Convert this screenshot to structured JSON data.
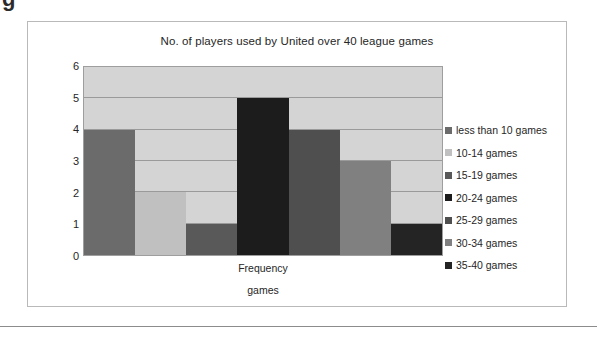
{
  "stray_glyph": "g",
  "chart_data": {
    "type": "bar",
    "title": "No. of players used by United over 40 league games",
    "xlabel": "games",
    "ylabel": "Frequency",
    "category_label": "Frequency",
    "ylim": [
      0,
      6
    ],
    "yticks": [
      "6",
      "5",
      "4",
      "3",
      "2",
      "1",
      "0"
    ],
    "grid": true,
    "legend_position": "right",
    "categories": [
      "less than 10 games",
      "10-14 games",
      "15-19 games",
      "20-24 games",
      "25-29 games",
      "30-34 games",
      "35-40 games"
    ],
    "values": [
      4,
      2,
      1,
      5,
      4,
      3,
      1
    ],
    "colors": [
      "#6b6b6b",
      "#c0c0c0",
      "#595959",
      "#1c1c1c",
      "#4f4f4f",
      "#808080",
      "#242424"
    ]
  },
  "colors": {
    "plot_background": "#d4d4d4",
    "gridline": "#9a9a9a",
    "frame_border": "#b9b9b9",
    "text": "#262626"
  }
}
